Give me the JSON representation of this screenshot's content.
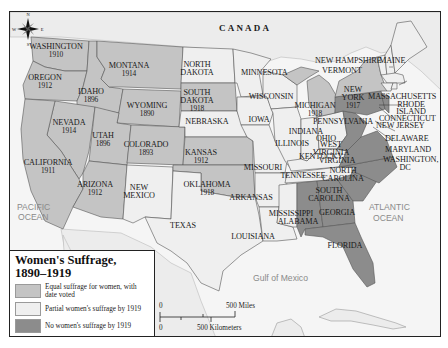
{
  "title": "Women's Suffrage,",
  "subtitle": "1890–1919",
  "colors": {
    "equal": "#c4c4c4",
    "partial": "#efefef",
    "none": "#8c8c8c",
    "water": "#f4f4f4",
    "foreign_land": "#e6e6e6",
    "border": "#555555"
  },
  "legend": {
    "items": [
      {
        "key": "equal",
        "label": "Equal suffrage for women, with date voted"
      },
      {
        "key": "partial",
        "label": "Partial women's suffrage by 1919"
      },
      {
        "key": "none",
        "label": "No women's suffrage by 1919"
      }
    ]
  },
  "scale": {
    "zero_top": "0",
    "miles_label": "500 Miles",
    "zero_bottom": "0",
    "km_label": "500 Kilometers"
  },
  "compass": {
    "n": "N",
    "s": "S",
    "e": "E",
    "w": "W"
  },
  "regions": {
    "canada": "CANADA",
    "pacific_line1": "PACIFIC",
    "pacific_line2": "OCEAN",
    "atlantic_line1": "ATLANTIC",
    "atlantic_line2": "OCEAN",
    "gulf": "Gulf of Mexico"
  },
  "states": [
    {
      "name": "WASHINGTON",
      "year": "1910",
      "status": "equal"
    },
    {
      "name": "OREGON",
      "year": "1912",
      "status": "equal"
    },
    {
      "name": "CALIFORNIA",
      "year": "1911",
      "status": "equal"
    },
    {
      "name": "IDAHO",
      "year": "1896",
      "status": "equal"
    },
    {
      "name": "NEVADA",
      "year": "1914",
      "status": "equal"
    },
    {
      "name": "MONTANA",
      "year": "1914",
      "status": "equal"
    },
    {
      "name": "WYOMING",
      "year": "1890",
      "status": "equal"
    },
    {
      "name": "UTAH",
      "year": "1896",
      "status": "equal"
    },
    {
      "name": "COLORADO",
      "year": "1893",
      "status": "equal"
    },
    {
      "name": "ARIZONA",
      "year": "1912",
      "status": "equal"
    },
    {
      "name": "NEW MEXICO",
      "year": "",
      "status": "partial"
    },
    {
      "name": "NORTH DAKOTA",
      "year": "",
      "status": "partial"
    },
    {
      "name": "SOUTH DAKOTA",
      "year": "1918",
      "status": "equal"
    },
    {
      "name": "NEBRASKA",
      "year": "",
      "status": "partial"
    },
    {
      "name": "KANSAS",
      "year": "1912",
      "status": "equal"
    },
    {
      "name": "OKLAHOMA",
      "year": "1918",
      "status": "equal"
    },
    {
      "name": "TEXAS",
      "year": "",
      "status": "partial"
    },
    {
      "name": "MINNESOTA",
      "year": "",
      "status": "partial"
    },
    {
      "name": "IOWA",
      "year": "",
      "status": "partial"
    },
    {
      "name": "MISSOURI",
      "year": "",
      "status": "partial"
    },
    {
      "name": "ARKANSAS",
      "year": "",
      "status": "partial"
    },
    {
      "name": "LOUISIANA",
      "year": "",
      "status": "partial"
    },
    {
      "name": "WISCONSIN",
      "year": "",
      "status": "partial"
    },
    {
      "name": "ILLINOIS",
      "year": "",
      "status": "partial"
    },
    {
      "name": "MICHIGAN",
      "year": "1918",
      "status": "equal"
    },
    {
      "name": "INDIANA",
      "year": "",
      "status": "partial"
    },
    {
      "name": "OHIO",
      "year": "",
      "status": "partial"
    },
    {
      "name": "KENTUCKY",
      "year": "",
      "status": "partial"
    },
    {
      "name": "TENNESSEE",
      "year": "",
      "status": "partial"
    },
    {
      "name": "MISSISSIPPI",
      "year": "",
      "status": "partial"
    },
    {
      "name": "ALABAMA",
      "year": "",
      "status": "none"
    },
    {
      "name": "GEORGIA",
      "year": "",
      "status": "none"
    },
    {
      "name": "FLORIDA",
      "year": "",
      "status": "none"
    },
    {
      "name": "SOUTH CAROLINA",
      "year": "",
      "status": "none"
    },
    {
      "name": "NORTH CAROLINA",
      "year": "",
      "status": "none"
    },
    {
      "name": "VIRGINIA",
      "year": "",
      "status": "none"
    },
    {
      "name": "WEST VIRGINIA",
      "year": "",
      "status": "none"
    },
    {
      "name": "PENNSYLVANIA",
      "year": "",
      "status": "none"
    },
    {
      "name": "NEW YORK",
      "year": "1917",
      "status": "equal"
    },
    {
      "name": "NEW JERSEY",
      "year": "",
      "status": "none"
    },
    {
      "name": "DELAWARE",
      "year": "",
      "status": "none"
    },
    {
      "name": "MARYLAND",
      "year": "",
      "status": "none"
    },
    {
      "name": "WASHINGTON, DC",
      "year": "",
      "status": "none"
    },
    {
      "name": "VERMONT",
      "year": "",
      "status": "partial"
    },
    {
      "name": "NEW HAMPSHIRE",
      "year": "",
      "status": "partial"
    },
    {
      "name": "MAINE",
      "year": "",
      "status": "partial"
    },
    {
      "name": "MASSACHUSETTS",
      "year": "",
      "status": "partial"
    },
    {
      "name": "RHODE ISLAND",
      "year": "",
      "status": "partial"
    },
    {
      "name": "CONNECTICUT",
      "year": "",
      "status": "partial"
    }
  ],
  "labels": {
    "washington": "WASHINGTON",
    "washington_year": "1910",
    "oregon": "OREGON",
    "oregon_year": "1912",
    "idaho": "IDAHO",
    "idaho_year": "1896",
    "montana": "MONTANA",
    "montana_year": "1914",
    "wyoming": "WYOMING",
    "wyoming_year": "1890",
    "nevada": "NEVADA",
    "nevada_year": "1914",
    "utah": "UTAH",
    "utah_year": "1896",
    "colorado": "COLORADO",
    "colorado_year": "1893",
    "california": "CALIFORNIA",
    "california_year": "1911",
    "arizona": "ARIZONA",
    "arizona_year": "1912",
    "new_mexico_1": "NEW",
    "new_mexico_2": "MEXICO",
    "north_dakota_1": "NORTH",
    "north_dakota_2": "DAKOTA",
    "south_dakota_1": "SOUTH",
    "south_dakota_2": "DAKOTA",
    "south_dakota_year": "1918",
    "nebraska": "NEBRASKA",
    "kansas": "KANSAS",
    "kansas_year": "1912",
    "oklahoma": "OKLAHOMA",
    "oklahoma_year": "1918",
    "texas": "TEXAS",
    "minnesota": "MINNESOTA",
    "iowa": "IOWA",
    "missouri": "MISSOURI",
    "arkansas": "ARKANSAS",
    "louisiana": "LOUISIANA",
    "wisconsin": "WISCONSIN",
    "illinois": "ILLINOIS",
    "michigan": "MICHIGAN",
    "michigan_year": "1918",
    "indiana": "INDIANA",
    "ohio": "OHIO",
    "kentucky": "KENTUCKY",
    "tennessee": "TENNESSEE",
    "mississippi": "MISSISSIPPI",
    "alabama": "ALABAMA",
    "georgia": "GEORGIA",
    "florida": "FLORIDA",
    "south_carolina_1": "SOUTH",
    "south_carolina_2": "CAROLINA",
    "north_carolina_1": "NORTH",
    "north_carolina_2": "CAROLINA",
    "west_virginia_1": "WEST",
    "west_virginia_2": "VIRGINIA",
    "virginia": "VIRGINIA",
    "pennsylvania": "PENNSYLVANIA",
    "new_york_1": "NEW",
    "new_york_2": "YORK",
    "new_york_year": "1917",
    "new_jersey": "NEW JERSEY",
    "delaware": "DELAWARE",
    "maryland": "MARYLAND",
    "dc_1": "WASHINGTON,",
    "dc_2": "DC",
    "vermont": "VERMONT",
    "new_hampshire": "NEW HAMPSHIRE",
    "maine": "MAINE",
    "massachusetts": "MASSACHUSETTS",
    "rhode_island_1": "RHODE",
    "rhode_island_2": "ISLAND",
    "connecticut": "CONNECTICUT"
  }
}
